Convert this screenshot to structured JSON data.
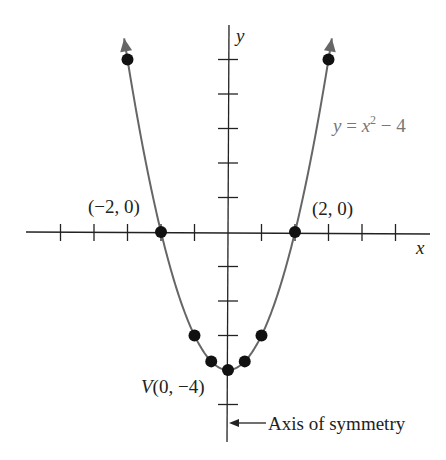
{
  "chart_data": {
    "type": "line",
    "title": "",
    "equation_label": "y = x² − 4",
    "xlabel": "x",
    "ylabel": "y",
    "xlim": [
      -6,
      6
    ],
    "ylim": [
      -6,
      6
    ],
    "x_ticks": [
      -5,
      -4,
      -3,
      -2,
      -1,
      1,
      2,
      3,
      4,
      5
    ],
    "y_ticks": [
      -5,
      -3,
      -2,
      -1,
      1,
      2,
      3,
      4,
      5
    ],
    "curve": {
      "function": "y = x^2 - 4",
      "x_range": [
        -3.1,
        3.1
      ],
      "color": "#666666"
    },
    "points": [
      {
        "x": -3,
        "y": 5
      },
      {
        "x": -2,
        "y": 0
      },
      {
        "x": -1,
        "y": -3
      },
      {
        "x": -0.5,
        "y": -3.75
      },
      {
        "x": 0,
        "y": -4
      },
      {
        "x": 0.5,
        "y": -3.75
      },
      {
        "x": 1,
        "y": -3
      },
      {
        "x": 2,
        "y": 0
      },
      {
        "x": 3,
        "y": 5
      }
    ],
    "annotations": [
      {
        "text": "(−2, 0)",
        "x": -2,
        "y": 0
      },
      {
        "text": "(2, 0)",
        "x": 2,
        "y": 0
      },
      {
        "text": "V(0, −4)",
        "x": 0,
        "y": -4
      },
      {
        "text": "Axis of symmetry",
        "x": 0,
        "y": -5.5
      }
    ],
    "grid": false,
    "legend": null
  },
  "labels": {
    "x_axis": "x",
    "y_axis": "y",
    "equation_y": "y",
    "equation_eq": " = ",
    "equation_x": "x",
    "equation_exp": "2",
    "equation_rest": " − 4",
    "root_left": "(−2, 0)",
    "root_right": "(2, 0)",
    "vertex_v": "V",
    "vertex_rest": "(0, −4)",
    "axis_symmetry": "Axis of symmetry"
  },
  "colors": {
    "axis": "#222222",
    "curve": "#666666",
    "points": "#111111",
    "equation_text": "#777777"
  }
}
